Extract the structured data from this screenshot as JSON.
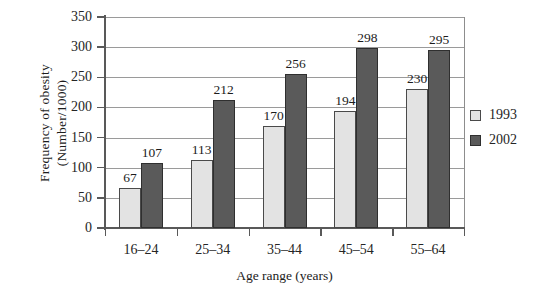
{
  "chart_data": {
    "type": "bar",
    "title": "",
    "xlabel": "Age range (years)",
    "ylabel": "Frequency of obesity (Number/1000)",
    "ylabel_lines": [
      "Frequency of obesity",
      "(Number/1000)"
    ],
    "categories": [
      "16–24",
      "25–34",
      "35–44",
      "45–54",
      "55–64"
    ],
    "series": [
      {
        "name": "1993",
        "color": "#e3e3e3",
        "values": [
          67,
          113,
          170,
          194,
          230
        ]
      },
      {
        "name": "2002",
        "color": "#5a5a5a",
        "values": [
          107,
          212,
          256,
          298,
          295
        ]
      }
    ],
    "ylim": [
      0,
      350
    ],
    "ytick_values": [
      0,
      50,
      100,
      150,
      200,
      250,
      300,
      350
    ],
    "ytick_labels": [
      "0",
      "50",
      "100",
      "150",
      "200",
      "250",
      "300",
      "350"
    ],
    "grid": "horizontal",
    "legend_position": "right",
    "data_labels": true
  },
  "legend": {
    "entries": [
      {
        "label": "1993",
        "swatch": "light-gray-swatch"
      },
      {
        "label": "2002",
        "swatch": "dark-gray-swatch"
      }
    ]
  }
}
